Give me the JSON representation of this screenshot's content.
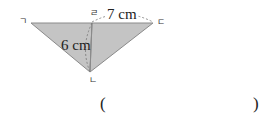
{
  "diagram": {
    "vertices": {
      "left": "ㄱ",
      "top": "ㄹ",
      "right": "ㄷ",
      "bottom": "ㄴ"
    },
    "measurements": {
      "top_segment": "7 cm",
      "height": "6 cm"
    },
    "colors": {
      "fill": "#c4c4c4",
      "stroke": "#8a8a8a",
      "dashed": "#777777"
    }
  },
  "answer": {
    "open_paren": "(",
    "close_paren": ")",
    "value": ""
  }
}
